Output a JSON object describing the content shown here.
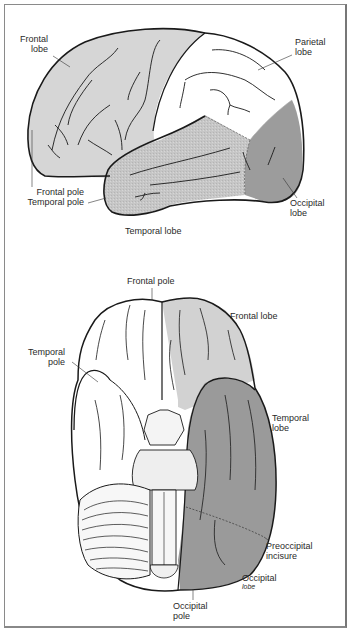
{
  "figure": {
    "type": "anatomical-diagram",
    "colors": {
      "frontal": "#d6d6d6",
      "parietal": "#ffffff",
      "temporal": "#c4c4c4",
      "occipital": "#9a9a9a",
      "outline": "#1a1a1a",
      "border": "#8a8a8a",
      "label": "#2a2a2a"
    }
  },
  "lateral_view": {
    "labels": {
      "frontal_lobe": [
        "Frontal",
        "lobe"
      ],
      "parietal_lobe": [
        "Parietal",
        "lobe"
      ],
      "frontal_pole": "Frontal pole",
      "temporal_pole": "Temporal pole",
      "occipital_lobe": [
        "Occipital",
        "lobe"
      ],
      "temporal_lobe": "Temporal lobe"
    }
  },
  "inferior_view": {
    "labels": {
      "frontal_pole": "Frontal pole",
      "frontal_lobe": "Frontal lobe",
      "temporal_pole": [
        "Temporal",
        "pole"
      ],
      "temporal_lobe": [
        "Temporal",
        "lobe"
      ],
      "preoccipital_incisure": [
        "Preoccipital",
        "incisure"
      ],
      "occipital_lobe": [
        "Occipital",
        "lobe"
      ],
      "occipital_pole": [
        "Occipital",
        "pole"
      ]
    }
  }
}
